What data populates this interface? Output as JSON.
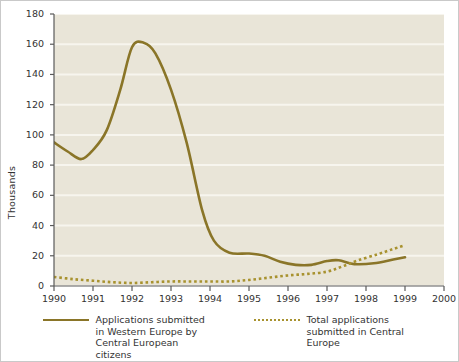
{
  "chart_data": {
    "type": "line",
    "title": "",
    "xlabel": "",
    "ylabel": "Thousands",
    "xlim": [
      1990,
      2000
    ],
    "ylim": [
      0,
      180
    ],
    "grid": true,
    "legend_position": "bottom",
    "x_ticks": [
      "1990",
      "1991",
      "1992",
      "1993",
      "1994",
      "1995",
      "1996",
      "1997",
      "1998",
      "1999",
      "2000"
    ],
    "y_ticks": [
      "0",
      "20",
      "40",
      "60",
      "80",
      "100",
      "120",
      "140",
      "160",
      "180"
    ],
    "series": [
      {
        "name": "Applications submitted in Western Europe by Central European citizens",
        "style": "solid",
        "color": "#8a7528",
        "x": [
          1990.0,
          1990.35,
          1990.7,
          1991.0,
          1991.35,
          1991.7,
          1992.0,
          1992.3,
          1992.6,
          1993.0,
          1993.4,
          1993.8,
          1994.1,
          1994.5,
          1995.0,
          1995.4,
          1995.8,
          1996.2,
          1996.6,
          1997.0,
          1997.3,
          1997.7,
          1998.2,
          1998.7,
          1999.0
        ],
        "y": [
          95,
          89,
          84,
          90,
          103,
          130,
          158,
          161,
          154,
          130,
          95,
          50,
          30,
          22,
          21.5,
          20,
          16,
          14,
          14,
          16.5,
          17,
          14.5,
          15,
          17.5,
          19
        ]
      },
      {
        "name": "Total applications submitted in Central Europe",
        "style": "dotted",
        "color": "#a8922f",
        "x": [
          1990.0,
          1990.5,
          1991.0,
          1991.5,
          1992.0,
          1992.5,
          1993.0,
          1993.5,
          1994.0,
          1994.5,
          1995.0,
          1995.5,
          1996.0,
          1996.5,
          1997.0,
          1997.4,
          1997.8,
          1998.3,
          1998.7,
          1999.0
        ],
        "y": [
          6,
          4.5,
          3.5,
          2.5,
          2,
          2.5,
          3,
          3,
          3,
          3,
          4,
          5.5,
          7,
          8,
          9.5,
          13,
          17,
          21,
          24.5,
          27
        ]
      }
    ],
    "colors": {
      "plot_background": "#e9e5d8",
      "gridline": "#f7f5ee",
      "axis": "#5a5a5a",
      "page_background": "#ffffff",
      "text": "#333333"
    }
  },
  "legend": {
    "entries": [
      {
        "marker": "solid-line-swatch",
        "label": "Applications submitted in Western Europe by Central European citizens"
      },
      {
        "marker": "dotted-line-swatch",
        "label": "Total applications submitted in Central Europe"
      }
    ]
  }
}
